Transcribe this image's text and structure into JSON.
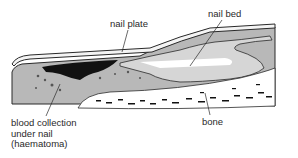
{
  "diagram": {
    "labels": {
      "nail_plate": "nail plate",
      "nail_bed": "nail bed",
      "bone": "bone",
      "blood_collection": [
        "blood collection",
        "under nail",
        "(haematoma)"
      ]
    },
    "colors": {
      "outline": "#2a2a2a",
      "soft_tissue": "#b8b8b8",
      "nail_bed_tissue": "#d6d6d6",
      "haematoma": "#111111",
      "bone_fill": "#ffffff",
      "nail": "#f4f4f4"
    }
  }
}
